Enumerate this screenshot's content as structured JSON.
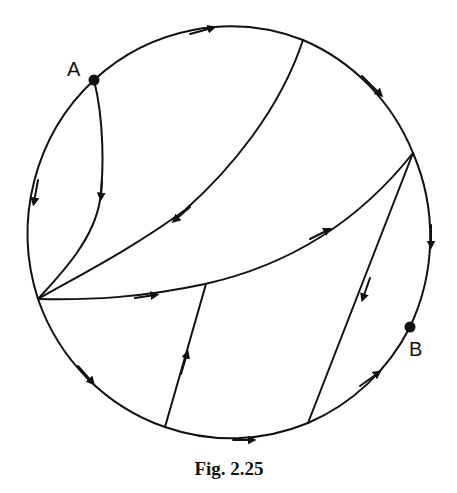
{
  "figure": {
    "caption": "Fig. 2.25",
    "points": {
      "A": {
        "label": "A",
        "x": 94,
        "y": 80
      },
      "B": {
        "label": "B",
        "x": 410,
        "y": 327
      }
    }
  },
  "colors": {
    "ink": "#111111",
    "background": "#ffffff"
  }
}
